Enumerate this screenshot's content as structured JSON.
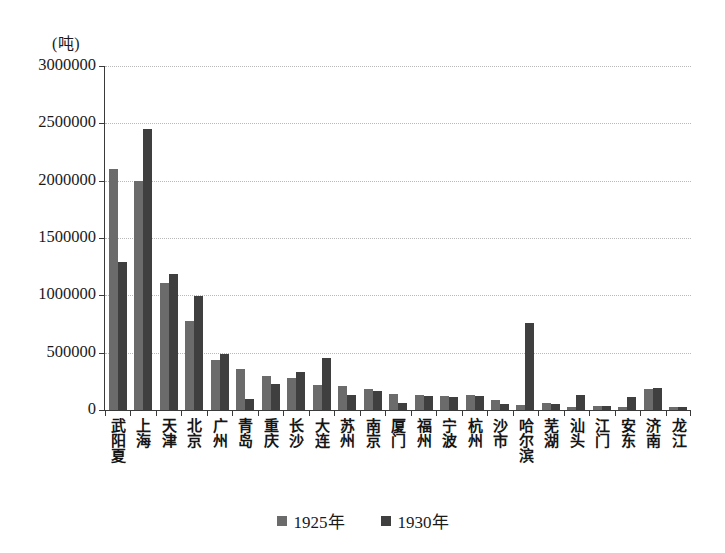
{
  "chart_data": {
    "type": "bar",
    "title": "",
    "subtitle": "",
    "xlabel": "",
    "ylabel": "(吨)",
    "unit_caption": "(吨)",
    "ylim": [
      0,
      3000000
    ],
    "ytick_step": 500000,
    "yticks": [
      0,
      500000,
      1000000,
      1500000,
      2000000,
      2500000,
      3000000
    ],
    "ytick_labels": [
      "0",
      "500000",
      "1000000",
      "1500000",
      "2000000",
      "2500000",
      "3000000"
    ],
    "grid": true,
    "legend_position": "bottom",
    "categories": [
      "武阳夏",
      "上海",
      "天津",
      "北京",
      "广州",
      "青岛",
      "重庆",
      "长沙",
      "大连",
      "苏州",
      "南京",
      "厦门",
      "福州",
      "宁波",
      "杭州",
      "沙市",
      "哈尔滨",
      "芜湖",
      "汕头",
      "江门",
      "安东",
      "济南",
      "龙江"
    ],
    "series": [
      {
        "name": "1925年",
        "color": "#6b6b6b",
        "values": [
          2100000,
          2000000,
          1110000,
          780000,
          440000,
          355000,
          300000,
          280000,
          220000,
          210000,
          185000,
          140000,
          130000,
          125000,
          130000,
          90000,
          40000,
          60000,
          30000,
          35000,
          30000,
          185000,
          25000
        ]
      },
      {
        "name": "1930年",
        "color": "#3f3f3f",
        "values": [
          1290000,
          2450000,
          1190000,
          990000,
          490000,
          100000,
          230000,
          330000,
          450000,
          130000,
          165000,
          65000,
          120000,
          115000,
          125000,
          55000,
          760000,
          55000,
          130000,
          35000,
          110000,
          195000,
          25000
        ]
      }
    ]
  },
  "legend": {
    "items": [
      {
        "label": "1925年",
        "swatch_icon": "square-swatch-icon",
        "color": "#6b6b6b"
      },
      {
        "label": "1930年",
        "swatch_icon": "square-swatch-icon",
        "color": "#3f3f3f"
      }
    ]
  }
}
